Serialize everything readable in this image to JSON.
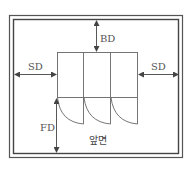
{
  "diagram": {
    "title": "",
    "labels": {
      "back_distance": "BD",
      "side_distance_left": "SD",
      "side_distance_right": "SD",
      "front_distance": "FD",
      "front_side": "앞면"
    },
    "elements": {
      "room": "double-line enclosure",
      "cabinet": "three-door cabinet with swing arcs",
      "door_count": 3
    },
    "colors": {
      "line": "#555555",
      "border": "#444444",
      "text": "#555555",
      "background": "#ffffff"
    }
  }
}
